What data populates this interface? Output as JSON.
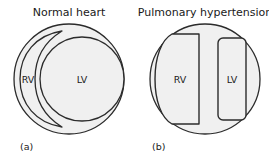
{
  "figure": {
    "background_color": "#ffffff",
    "panels": [
      {
        "id": "a",
        "title": "Normal heart",
        "caption": "(a)",
        "chambers": [
          {
            "id": "rv",
            "label": "RV",
            "shape": "crescent"
          },
          {
            "id": "lv",
            "label": "LV",
            "shape": "circle"
          }
        ]
      },
      {
        "id": "b",
        "title": "Pulmonary hypertension",
        "caption": "(b)",
        "chambers": [
          {
            "id": "rv",
            "label": "RV",
            "shape": "d-shaped-dilated"
          },
          {
            "id": "lv",
            "label": "LV",
            "shape": "compressed-rounded-rect"
          }
        ]
      }
    ],
    "colors": {
      "fill": "#f0f0f0",
      "stroke": "#2b2b2b",
      "text": "#1a1a1a"
    }
  }
}
